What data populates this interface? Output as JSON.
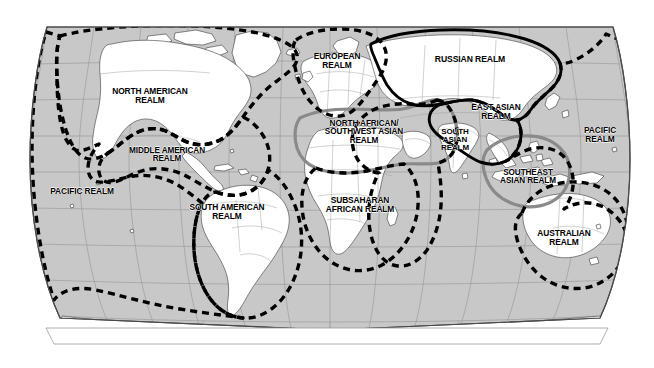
{
  "map": {
    "projection": "robinson",
    "background_color": "#ffffff",
    "ocean_color": "#c9c9c9",
    "land_color": "#ffffff",
    "graticule_color": "#8d8d8d",
    "country_border_color": "#9a9a9a",
    "coastline_color": "#3a3a3a",
    "frame_color": "#4a4a4a",
    "boundary_dashed_color": "#000000",
    "boundary_solid_color": "#000000",
    "boundary_gray_color": "#8a8a8a",
    "realms": [
      {
        "id": "north-american",
        "label": "NORTH AMERICAN\nREALM",
        "x": 150,
        "y": 96,
        "font_size": 8.4,
        "boundary_style": "dashed"
      },
      {
        "id": "middle-american",
        "label": "MIDDLE AMERICAN\nREALM",
        "x": 167,
        "y": 155,
        "font_size": 8.2,
        "boundary_style": "dashed"
      },
      {
        "id": "south-american",
        "label": "SOUTH AMERICAN\nREALM",
        "x": 227,
        "y": 212,
        "font_size": 8.4,
        "boundary_style": "dashed"
      },
      {
        "id": "pacific-west",
        "label": "PACIFIC REALM",
        "x": 82,
        "y": 191,
        "font_size": 8.4,
        "boundary_style": "dashed"
      },
      {
        "id": "pacific-east",
        "label": "PACIFIC REALM",
        "x": 600,
        "y": 135,
        "font_size": 8.4,
        "boundary_style": "dashed"
      },
      {
        "id": "european",
        "label": "EUROPEAN\nREALM",
        "x": 337,
        "y": 61,
        "font_size": 8.4,
        "boundary_style": "dashed"
      },
      {
        "id": "russian",
        "label": "RUSSIAN REALM",
        "x": 470,
        "y": 59,
        "font_size": 8.6,
        "boundary_style": "solid"
      },
      {
        "id": "north-african-southwest-asian",
        "label": "NORTH AFRICAN/\nSOUTHWEST ASIAN\nREALM",
        "x": 364,
        "y": 133,
        "font_size": 8.2,
        "boundary_style": "gray"
      },
      {
        "id": "subsaharan-african",
        "label": "SUBSAHARAN\nAFRICAN REALM",
        "x": 360,
        "y": 205,
        "font_size": 8.4,
        "boundary_style": "dashed"
      },
      {
        "id": "south-asian",
        "label": "SOUTH\nASIAN\nREALM",
        "x": 455,
        "y": 140,
        "font_size": 8.0,
        "boundary_style": "dashed"
      },
      {
        "id": "east-asian",
        "label": "EAST ASIAN\nREALM",
        "x": 496,
        "y": 112,
        "font_size": 8.4,
        "boundary_style": "solid"
      },
      {
        "id": "southeast-asian",
        "label": "SOUTHEAST\nASIAN REALM",
        "x": 528,
        "y": 177,
        "font_size": 8.2,
        "boundary_style": "gray"
      },
      {
        "id": "australian",
        "label": "AUSTRALIAN\nREALM",
        "x": 564,
        "y": 238,
        "font_size": 8.4,
        "boundary_style": "dashed"
      }
    ]
  }
}
